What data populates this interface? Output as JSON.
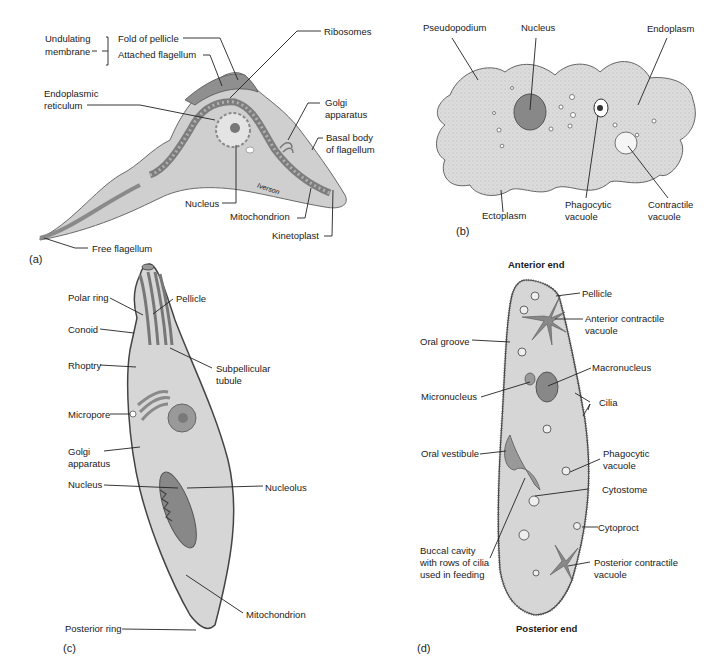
{
  "panels": {
    "a": {
      "tag": "(a)",
      "bracket_label_1": "Undulating",
      "bracket_label_2": "membrane",
      "labels": {
        "fold_of_pellicle": "Fold of pellicle",
        "attached_flagellum": "Attached flagellum",
        "ribosomes": "Ribosomes",
        "endoplasmic_1": "Endoplasmic",
        "endoplasmic_2": "reticulum",
        "golgi_1": "Golgi",
        "golgi_2": "apparatus",
        "basal_1": "Basal body",
        "basal_2": "of flagellum",
        "nucleus": "Nucleus",
        "mitochondrion": "Mitochondrion",
        "kinetoplast": "Kinetoplast",
        "free_flagellum": "Free flagellum",
        "signature": "Iverson"
      }
    },
    "b": {
      "tag": "(b)",
      "labels": {
        "pseudopodium": "Pseudopodium",
        "nucleus": "Nucleus",
        "endoplasm": "Endoplasm",
        "ectoplasm": "Ectoplasm",
        "phago_1": "Phagocytic",
        "phago_2": "vacuole",
        "contr_1": "Contractile",
        "contr_2": "vacuole"
      }
    },
    "c": {
      "tag": "(c)",
      "labels": {
        "polar_ring": "Polar ring",
        "pellicle": "Pellicle",
        "conoid": "Conoid",
        "rhoptry": "Rhoptry",
        "subpell_1": "Subpellicular",
        "subpell_2": "tubule",
        "micropore": "Micropore",
        "golgi_1": "Golgi",
        "golgi_2": "apparatus",
        "nucleus": "Nucleus",
        "nucleolus": "Nucleolus",
        "mitochondrion": "Mitochondrion",
        "posterior_ring": "Posterior ring"
      }
    },
    "d": {
      "tag": "(d)",
      "anterior": "Anterior end",
      "posterior": "Posterior end",
      "labels": {
        "pellicle": "Pellicle",
        "antcv_1": "Anterior contractile",
        "antcv_2": "vacuole",
        "oral_groove": "Oral groove",
        "macronucleus": "Macronucleus",
        "micronucleus": "Micronucleus",
        "cilia": "Cilia",
        "oral_vestibule": "Oral vestibule",
        "phago_1": "Phagocytic",
        "phago_2": "vacuole",
        "cytostome": "Cytostome",
        "cytoproct": "Cytoproct",
        "buccal_1": "Buccal cavity",
        "buccal_2": "with rows of cilia",
        "buccal_3": "used in feeding",
        "postcv_1": "Posterior contractile",
        "postcv_2": "vacuole"
      }
    }
  },
  "colors": {
    "cell_fill": "#d9d9d9",
    "cell_dark": "#9a9a9a",
    "organelle": "#8c8c8c",
    "line": "#222222"
  }
}
